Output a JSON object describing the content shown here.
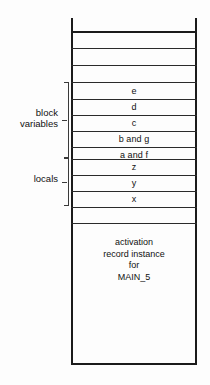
{
  "diagram": {
    "frame": {
      "style": "open-top rectangle",
      "color": "#1b1b1b"
    },
    "cells": [
      {
        "name": "cell-empty-1",
        "label": ""
      },
      {
        "name": "cell-empty-2",
        "label": ""
      },
      {
        "name": "cell-empty-3",
        "label": ""
      },
      {
        "name": "cell-empty-4",
        "label": ""
      },
      {
        "name": "cell-e",
        "label": "e"
      },
      {
        "name": "cell-d",
        "label": "d"
      },
      {
        "name": "cell-c",
        "label": "c"
      },
      {
        "name": "cell-b-and-g",
        "label": "b and g"
      },
      {
        "name": "cell-a-and-f",
        "label": "a and f"
      },
      {
        "name": "cell-z",
        "label": "z"
      },
      {
        "name": "cell-y",
        "label": "y"
      },
      {
        "name": "cell-x",
        "label": "x"
      }
    ],
    "activation_record": {
      "line1": "activation",
      "line2": "record instance",
      "line3": "for",
      "line4": "MAIN_5"
    },
    "groups": [
      {
        "name": "block-variables",
        "label_line1": "block",
        "label_line2": "variables",
        "covers": [
          "e",
          "d",
          "c",
          "b and g",
          "a and f"
        ]
      },
      {
        "name": "locals",
        "label_line1": "locals",
        "label_line2": "",
        "covers": [
          "z",
          "y",
          "x"
        ]
      }
    ]
  }
}
